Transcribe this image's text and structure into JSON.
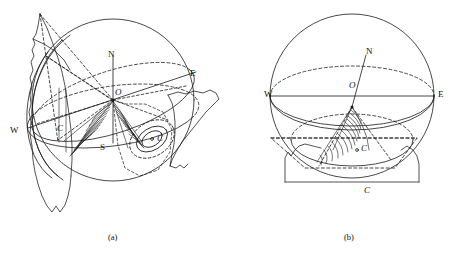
{
  "figure": {
    "type": "scientific-diagram",
    "panels": [
      {
        "id": "a",
        "caption": "(a)",
        "labels": {
          "north": "N",
          "south": "S",
          "east": "E",
          "west": "W",
          "center": "O",
          "point_c_prime": "C",
          "point_c": "C"
        }
      },
      {
        "id": "b",
        "caption": "(b)",
        "labels": {
          "north": "N",
          "east": "E",
          "west": "W",
          "center": "O",
          "point_c_inner": "C",
          "point_c_bottom": "C"
        }
      }
    ],
    "colors": {
      "stroke": "#1a1a1a",
      "background": "#ffffff"
    }
  }
}
